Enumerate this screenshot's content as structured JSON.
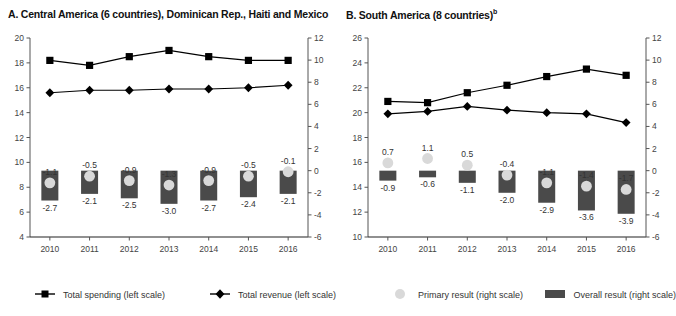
{
  "panels": {
    "a": {
      "title_prefix": "A. Central America (6 countries), Dominican Rep., Haiti and Mexico",
      "title_sup": ""
    },
    "b": {
      "title_prefix": "B. South America (8 countries)",
      "title_sup": "b"
    }
  },
  "legend": {
    "items": [
      {
        "label": "Total spending (left scale)",
        "marker": "square-line-marker",
        "color": "#000000"
      },
      {
        "label": "Total revenue (left scale)",
        "marker": "diamond-line-marker",
        "color": "#000000"
      },
      {
        "label": "Primary result (right scale)",
        "marker": "light-circle-marker",
        "color": "#d9d9d9"
      },
      {
        "label": "Overall result (right scale)",
        "marker": "dark-bar-marker",
        "color": "#4a4a4a"
      }
    ]
  },
  "chart_data": [
    {
      "type": "line",
      "title": "A. Central America (6 countries), Dominican Rep., Haiti and Mexico",
      "xlabel": "",
      "ylabel": "",
      "grid": false,
      "legend_position": "bottom",
      "categories": [
        "2010",
        "2011",
        "2012",
        "2013",
        "2014",
        "2015",
        "2016"
      ],
      "left_axis": {
        "ylim": [
          4,
          20
        ],
        "ticks": [
          4,
          6,
          8,
          10,
          12,
          14,
          16,
          18,
          20
        ]
      },
      "right_axis": {
        "ylim": [
          -6,
          12
        ],
        "ticks": [
          -6,
          -4,
          -2,
          0,
          2,
          4,
          6,
          8,
          10,
          12
        ]
      },
      "series": [
        {
          "name": "Total spending (left scale)",
          "axis": "left",
          "type": "line",
          "marker": "square",
          "values": [
            18.2,
            17.8,
            18.5,
            19.0,
            18.5,
            18.2,
            18.2
          ]
        },
        {
          "name": "Total revenue (left scale)",
          "axis": "left",
          "type": "line",
          "marker": "diamond",
          "values": [
            15.6,
            15.8,
            15.8,
            15.9,
            15.9,
            16.0,
            16.2
          ]
        },
        {
          "name": "Primary result (right scale)",
          "axis": "right",
          "type": "point",
          "values": [
            -1.1,
            -0.5,
            -0.9,
            -1.3,
            -0.9,
            -0.5,
            -0.1
          ]
        },
        {
          "name": "Overall result (right scale)",
          "axis": "right",
          "type": "bar",
          "values": [
            -2.7,
            -2.1,
            -2.5,
            -3.0,
            -2.7,
            -2.4,
            -2.1
          ]
        }
      ]
    },
    {
      "type": "line",
      "title": "B. South America (8 countries)",
      "xlabel": "",
      "ylabel": "",
      "grid": false,
      "legend_position": "bottom",
      "categories": [
        "2010",
        "2011",
        "2012",
        "2013",
        "2014",
        "2015",
        "2016"
      ],
      "left_axis": {
        "ylim": [
          10,
          26
        ],
        "ticks": [
          10,
          12,
          14,
          16,
          18,
          20,
          22,
          24,
          26
        ]
      },
      "right_axis": {
        "ylim": [
          -6,
          12
        ],
        "ticks": [
          -6,
          -4,
          -2,
          0,
          2,
          4,
          6,
          8,
          10,
          12
        ]
      },
      "series": [
        {
          "name": "Total spending (left scale)",
          "axis": "left",
          "type": "line",
          "marker": "square",
          "values": [
            20.9,
            20.8,
            21.6,
            22.2,
            22.9,
            23.5,
            23.0
          ]
        },
        {
          "name": "Total revenue (left scale)",
          "axis": "left",
          "type": "line",
          "marker": "diamond",
          "values": [
            19.9,
            20.1,
            20.5,
            20.2,
            20.0,
            19.9,
            19.2
          ]
        },
        {
          "name": "Primary result (right scale)",
          "axis": "right",
          "type": "point",
          "values": [
            0.7,
            1.1,
            0.5,
            -0.4,
            -1.1,
            -1.4,
            -1.7
          ]
        },
        {
          "name": "Overall result (right scale)",
          "axis": "right",
          "type": "bar",
          "values": [
            -0.9,
            -0.6,
            -1.1,
            -2.0,
            -2.9,
            -3.6,
            -3.9
          ]
        }
      ]
    }
  ]
}
